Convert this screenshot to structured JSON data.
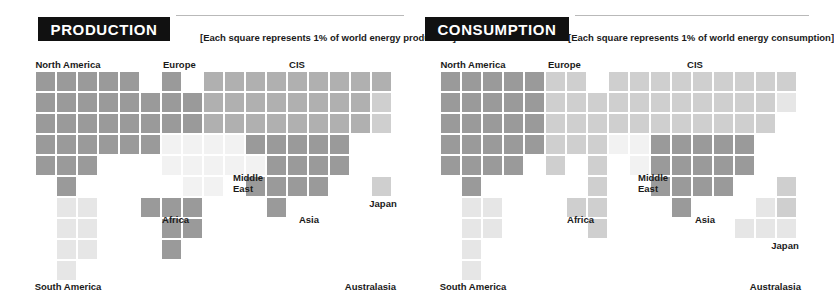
{
  "meta": {
    "canvas": {
      "width": 809,
      "height": 306
    },
    "background": "#ffffff",
    "cell": {
      "size": 19,
      "pitch": 21
    },
    "palette": {
      "dark": "#9a9a9a",
      "mid": "#b0b0b0",
      "light": "#cfcfcf",
      "pale": "#e6e6e6",
      "faint": "#f2f2f2",
      "header_bg": "#111111",
      "header_fg": "#ffffff",
      "rule": "#b9b9b9",
      "text": "#1a1a1a"
    }
  },
  "panels": [
    {
      "id": "production",
      "header": {
        "title": "PRODUCTION",
        "note": "[Each square represents 1% of world energy production]"
      },
      "labels": [
        {
          "name": "north-america",
          "text": "North America",
          "x": 68,
          "y": 59,
          "align": "c"
        },
        {
          "name": "europe",
          "text": "Europe",
          "x": 163,
          "y": 59,
          "align": "l"
        },
        {
          "name": "cis",
          "text": "CIS",
          "x": 297,
          "y": 59,
          "align": "c"
        },
        {
          "name": "middle-east",
          "text": "Middle East",
          "x": 233,
          "y": 172,
          "align": "l",
          "wrap": true
        },
        {
          "name": "africa",
          "text": "Africa",
          "x": 189,
          "y": 214,
          "align": "r"
        },
        {
          "name": "asia",
          "text": "Asia",
          "x": 309,
          "y": 214,
          "align": "c"
        },
        {
          "name": "japan",
          "text": "Japan",
          "x": 383,
          "y": 198,
          "align": "c"
        },
        {
          "name": "south-america",
          "text": "South America",
          "x": 68,
          "y": 281,
          "align": "c"
        },
        {
          "name": "australasia",
          "text": "Australasia",
          "x": 396,
          "y": 281,
          "align": "r"
        }
      ],
      "squares": [
        {
          "r": 0,
          "c": 0,
          "t": "dark"
        },
        {
          "r": 0,
          "c": 1,
          "t": "dark"
        },
        {
          "r": 0,
          "c": 2,
          "t": "dark"
        },
        {
          "r": 0,
          "c": 3,
          "t": "dark"
        },
        {
          "r": 0,
          "c": 4,
          "t": "dark"
        },
        {
          "r": 1,
          "c": 0,
          "t": "dark"
        },
        {
          "r": 1,
          "c": 1,
          "t": "dark"
        },
        {
          "r": 1,
          "c": 2,
          "t": "dark"
        },
        {
          "r": 1,
          "c": 3,
          "t": "dark"
        },
        {
          "r": 1,
          "c": 4,
          "t": "dark"
        },
        {
          "r": 2,
          "c": 0,
          "t": "dark"
        },
        {
          "r": 2,
          "c": 1,
          "t": "dark"
        },
        {
          "r": 2,
          "c": 2,
          "t": "dark"
        },
        {
          "r": 2,
          "c": 3,
          "t": "dark"
        },
        {
          "r": 2,
          "c": 4,
          "t": "dark"
        },
        {
          "r": 3,
          "c": 0,
          "t": "dark"
        },
        {
          "r": 3,
          "c": 1,
          "t": "dark"
        },
        {
          "r": 3,
          "c": 2,
          "t": "dark"
        },
        {
          "r": 3,
          "c": 3,
          "t": "dark"
        },
        {
          "r": 3,
          "c": 4,
          "t": "dark"
        },
        {
          "r": 4,
          "c": 0,
          "t": "dark"
        },
        {
          "r": 4,
          "c": 1,
          "t": "dark"
        },
        {
          "r": 4,
          "c": 2,
          "t": "dark"
        },
        {
          "r": 5,
          "c": 1,
          "t": "dark"
        },
        {
          "r": 6,
          "c": 1,
          "t": "pale"
        },
        {
          "r": 6,
          "c": 2,
          "t": "pale"
        },
        {
          "r": 7,
          "c": 1,
          "t": "pale"
        },
        {
          "r": 7,
          "c": 2,
          "t": "pale"
        },
        {
          "r": 8,
          "c": 1,
          "t": "pale"
        },
        {
          "r": 8,
          "c": 2,
          "t": "pale"
        },
        {
          "r": 9,
          "c": 1,
          "t": "pale"
        },
        {
          "r": 0,
          "c": 6,
          "t": "dark"
        },
        {
          "r": 1,
          "c": 5,
          "t": "dark"
        },
        {
          "r": 1,
          "c": 6,
          "t": "dark"
        },
        {
          "r": 1,
          "c": 7,
          "t": "dark"
        },
        {
          "r": 2,
          "c": 5,
          "t": "dark"
        },
        {
          "r": 2,
          "c": 6,
          "t": "dark"
        },
        {
          "r": 2,
          "c": 7,
          "t": "dark"
        },
        {
          "r": 3,
          "c": 5,
          "t": "dark"
        },
        {
          "r": 0,
          "c": 8,
          "t": "mid"
        },
        {
          "r": 0,
          "c": 9,
          "t": "mid"
        },
        {
          "r": 0,
          "c": 10,
          "t": "mid"
        },
        {
          "r": 0,
          "c": 11,
          "t": "mid"
        },
        {
          "r": 0,
          "c": 12,
          "t": "mid"
        },
        {
          "r": 0,
          "c": 13,
          "t": "mid"
        },
        {
          "r": 0,
          "c": 14,
          "t": "mid"
        },
        {
          "r": 0,
          "c": 15,
          "t": "mid"
        },
        {
          "r": 0,
          "c": 16,
          "t": "mid"
        },
        {
          "r": 1,
          "c": 8,
          "t": "mid"
        },
        {
          "r": 1,
          "c": 9,
          "t": "mid"
        },
        {
          "r": 1,
          "c": 10,
          "t": "mid"
        },
        {
          "r": 1,
          "c": 11,
          "t": "mid"
        },
        {
          "r": 1,
          "c": 12,
          "t": "mid"
        },
        {
          "r": 1,
          "c": 13,
          "t": "mid"
        },
        {
          "r": 1,
          "c": 14,
          "t": "mid"
        },
        {
          "r": 1,
          "c": 15,
          "t": "mid"
        },
        {
          "r": 1,
          "c": 16,
          "t": "light"
        },
        {
          "r": 2,
          "c": 8,
          "t": "mid"
        },
        {
          "r": 2,
          "c": 9,
          "t": "mid"
        },
        {
          "r": 2,
          "c": 10,
          "t": "mid"
        },
        {
          "r": 2,
          "c": 11,
          "t": "mid"
        },
        {
          "r": 2,
          "c": 12,
          "t": "mid"
        },
        {
          "r": 2,
          "c": 13,
          "t": "mid"
        },
        {
          "r": 2,
          "c": 14,
          "t": "mid"
        },
        {
          "r": 2,
          "c": 15,
          "t": "mid"
        },
        {
          "r": 2,
          "c": 16,
          "t": "light"
        },
        {
          "r": 3,
          "c": 6,
          "t": "faint"
        },
        {
          "r": 3,
          "c": 7,
          "t": "faint"
        },
        {
          "r": 3,
          "c": 8,
          "t": "faint"
        },
        {
          "r": 3,
          "c": 9,
          "t": "faint"
        },
        {
          "r": 3,
          "c": 10,
          "t": "dark"
        },
        {
          "r": 3,
          "c": 11,
          "t": "dark"
        },
        {
          "r": 3,
          "c": 12,
          "t": "dark"
        },
        {
          "r": 3,
          "c": 13,
          "t": "dark"
        },
        {
          "r": 3,
          "c": 14,
          "t": "dark"
        },
        {
          "r": 4,
          "c": 6,
          "t": "faint"
        },
        {
          "r": 4,
          "c": 7,
          "t": "faint"
        },
        {
          "r": 4,
          "c": 8,
          "t": "faint"
        },
        {
          "r": 4,
          "c": 9,
          "t": "faint"
        },
        {
          "r": 4,
          "c": 10,
          "t": "faint"
        },
        {
          "r": 4,
          "c": 11,
          "t": "dark"
        },
        {
          "r": 4,
          "c": 12,
          "t": "dark"
        },
        {
          "r": 4,
          "c": 13,
          "t": "dark"
        },
        {
          "r": 4,
          "c": 14,
          "t": "dark"
        },
        {
          "r": 5,
          "c": 7,
          "t": "faint"
        },
        {
          "r": 5,
          "c": 8,
          "t": "faint"
        },
        {
          "r": 5,
          "c": 10,
          "t": "dark"
        },
        {
          "r": 5,
          "c": 11,
          "t": "dark"
        },
        {
          "r": 5,
          "c": 12,
          "t": "dark"
        },
        {
          "r": 5,
          "c": 13,
          "t": "dark"
        },
        {
          "r": 5,
          "c": 16,
          "t": "light"
        },
        {
          "r": 6,
          "c": 5,
          "t": "dark"
        },
        {
          "r": 6,
          "c": 6,
          "t": "dark"
        },
        {
          "r": 6,
          "c": 7,
          "t": "dark"
        },
        {
          "r": 6,
          "c": 11,
          "t": "dark"
        },
        {
          "r": 7,
          "c": 6,
          "t": "dark"
        },
        {
          "r": 7,
          "c": 7,
          "t": "dark"
        },
        {
          "r": 8,
          "c": 6,
          "t": "dark"
        }
      ]
    },
    {
      "id": "consumption",
      "header": {
        "title": "CONSUMPTION",
        "note": "[Each square represents 1% of world energy consumption]"
      },
      "labels": [
        {
          "name": "north-america",
          "text": "North America",
          "x": 68,
          "y": 59,
          "align": "c"
        },
        {
          "name": "europe",
          "text": "Europe",
          "x": 143,
          "y": 59,
          "align": "l"
        },
        {
          "name": "cis",
          "text": "CIS",
          "x": 290,
          "y": 59,
          "align": "c"
        },
        {
          "name": "middle-east",
          "text": "Middle East",
          "x": 233,
          "y": 172,
          "align": "l",
          "wrap": true
        },
        {
          "name": "africa",
          "text": "Africa",
          "x": 189,
          "y": 214,
          "align": "r"
        },
        {
          "name": "asia",
          "text": "Asia",
          "x": 300,
          "y": 214,
          "align": "c"
        },
        {
          "name": "japan",
          "text": "Japan",
          "x": 380,
          "y": 240,
          "align": "c"
        },
        {
          "name": "south-america",
          "text": "South America",
          "x": 68,
          "y": 281,
          "align": "c"
        },
        {
          "name": "australasia",
          "text": "Australasia",
          "x": 396,
          "y": 281,
          "align": "r"
        }
      ],
      "squares": [
        {
          "r": 0,
          "c": 0,
          "t": "dark"
        },
        {
          "r": 0,
          "c": 1,
          "t": "dark"
        },
        {
          "r": 0,
          "c": 2,
          "t": "dark"
        },
        {
          "r": 0,
          "c": 3,
          "t": "dark"
        },
        {
          "r": 0,
          "c": 4,
          "t": "dark"
        },
        {
          "r": 1,
          "c": 0,
          "t": "dark"
        },
        {
          "r": 1,
          "c": 1,
          "t": "dark"
        },
        {
          "r": 1,
          "c": 2,
          "t": "dark"
        },
        {
          "r": 1,
          "c": 3,
          "t": "dark"
        },
        {
          "r": 1,
          "c": 4,
          "t": "dark"
        },
        {
          "r": 2,
          "c": 0,
          "t": "dark"
        },
        {
          "r": 2,
          "c": 1,
          "t": "dark"
        },
        {
          "r": 2,
          "c": 2,
          "t": "dark"
        },
        {
          "r": 2,
          "c": 3,
          "t": "dark"
        },
        {
          "r": 2,
          "c": 4,
          "t": "dark"
        },
        {
          "r": 3,
          "c": 0,
          "t": "dark"
        },
        {
          "r": 3,
          "c": 1,
          "t": "dark"
        },
        {
          "r": 3,
          "c": 2,
          "t": "dark"
        },
        {
          "r": 3,
          "c": 3,
          "t": "dark"
        },
        {
          "r": 3,
          "c": 4,
          "t": "dark"
        },
        {
          "r": 4,
          "c": 0,
          "t": "dark"
        },
        {
          "r": 4,
          "c": 1,
          "t": "dark"
        },
        {
          "r": 4,
          "c": 2,
          "t": "dark"
        },
        {
          "r": 4,
          "c": 3,
          "t": "dark"
        },
        {
          "r": 5,
          "c": 1,
          "t": "dark"
        },
        {
          "r": 6,
          "c": 1,
          "t": "pale"
        },
        {
          "r": 6,
          "c": 2,
          "t": "pale"
        },
        {
          "r": 7,
          "c": 1,
          "t": "pale"
        },
        {
          "r": 7,
          "c": 2,
          "t": "pale"
        },
        {
          "r": 8,
          "c": 1,
          "t": "pale"
        },
        {
          "r": 9,
          "c": 1,
          "t": "pale"
        },
        {
          "r": 0,
          "c": 5,
          "t": "light"
        },
        {
          "r": 0,
          "c": 6,
          "t": "light"
        },
        {
          "r": 1,
          "c": 5,
          "t": "light"
        },
        {
          "r": 1,
          "c": 6,
          "t": "light"
        },
        {
          "r": 1,
          "c": 7,
          "t": "light"
        },
        {
          "r": 2,
          "c": 5,
          "t": "light"
        },
        {
          "r": 2,
          "c": 6,
          "t": "light"
        },
        {
          "r": 2,
          "c": 7,
          "t": "light"
        },
        {
          "r": 3,
          "c": 5,
          "t": "light"
        },
        {
          "r": 3,
          "c": 6,
          "t": "light"
        },
        {
          "r": 3,
          "c": 7,
          "t": "light"
        },
        {
          "r": 4,
          "c": 5,
          "t": "light"
        },
        {
          "r": 0,
          "c": 8,
          "t": "light"
        },
        {
          "r": 0,
          "c": 9,
          "t": "light"
        },
        {
          "r": 0,
          "c": 10,
          "t": "light"
        },
        {
          "r": 0,
          "c": 11,
          "t": "light"
        },
        {
          "r": 0,
          "c": 12,
          "t": "light"
        },
        {
          "r": 0,
          "c": 13,
          "t": "light"
        },
        {
          "r": 0,
          "c": 14,
          "t": "light"
        },
        {
          "r": 0,
          "c": 15,
          "t": "light"
        },
        {
          "r": 0,
          "c": 16,
          "t": "light"
        },
        {
          "r": 1,
          "c": 8,
          "t": "light"
        },
        {
          "r": 1,
          "c": 9,
          "t": "light"
        },
        {
          "r": 1,
          "c": 10,
          "t": "light"
        },
        {
          "r": 1,
          "c": 11,
          "t": "light"
        },
        {
          "r": 1,
          "c": 12,
          "t": "light"
        },
        {
          "r": 1,
          "c": 13,
          "t": "light"
        },
        {
          "r": 1,
          "c": 14,
          "t": "light"
        },
        {
          "r": 1,
          "c": 15,
          "t": "light"
        },
        {
          "r": 1,
          "c": 16,
          "t": "pale"
        },
        {
          "r": 2,
          "c": 8,
          "t": "light"
        },
        {
          "r": 2,
          "c": 9,
          "t": "light"
        },
        {
          "r": 2,
          "c": 10,
          "t": "light"
        },
        {
          "r": 2,
          "c": 11,
          "t": "light"
        },
        {
          "r": 2,
          "c": 12,
          "t": "light"
        },
        {
          "r": 2,
          "c": 13,
          "t": "light"
        },
        {
          "r": 2,
          "c": 14,
          "t": "light"
        },
        {
          "r": 2,
          "c": 15,
          "t": "light"
        },
        {
          "r": 3,
          "c": 8,
          "t": "faint"
        },
        {
          "r": 3,
          "c": 9,
          "t": "faint"
        },
        {
          "r": 3,
          "c": 10,
          "t": "dark"
        },
        {
          "r": 3,
          "c": 11,
          "t": "dark"
        },
        {
          "r": 3,
          "c": 12,
          "t": "dark"
        },
        {
          "r": 3,
          "c": 13,
          "t": "dark"
        },
        {
          "r": 3,
          "c": 14,
          "t": "dark"
        },
        {
          "r": 4,
          "c": 7,
          "t": "light"
        },
        {
          "r": 4,
          "c": 9,
          "t": "faint"
        },
        {
          "r": 4,
          "c": 10,
          "t": "dark"
        },
        {
          "r": 4,
          "c": 11,
          "t": "dark"
        },
        {
          "r": 4,
          "c": 12,
          "t": "dark"
        },
        {
          "r": 4,
          "c": 13,
          "t": "dark"
        },
        {
          "r": 4,
          "c": 14,
          "t": "dark"
        },
        {
          "r": 5,
          "c": 7,
          "t": "light"
        },
        {
          "r": 5,
          "c": 10,
          "t": "dark"
        },
        {
          "r": 5,
          "c": 11,
          "t": "dark"
        },
        {
          "r": 5,
          "c": 12,
          "t": "dark"
        },
        {
          "r": 5,
          "c": 13,
          "t": "dark"
        },
        {
          "r": 5,
          "c": 16,
          "t": "light"
        },
        {
          "r": 6,
          "c": 6,
          "t": "light"
        },
        {
          "r": 6,
          "c": 7,
          "t": "light"
        },
        {
          "r": 6,
          "c": 11,
          "t": "dark"
        },
        {
          "r": 6,
          "c": 15,
          "t": "pale"
        },
        {
          "r": 6,
          "c": 16,
          "t": "light"
        },
        {
          "r": 7,
          "c": 7,
          "t": "light"
        },
        {
          "r": 7,
          "c": 14,
          "t": "pale"
        },
        {
          "r": 7,
          "c": 15,
          "t": "pale"
        },
        {
          "r": 7,
          "c": 16,
          "t": "pale"
        }
      ]
    }
  ]
}
